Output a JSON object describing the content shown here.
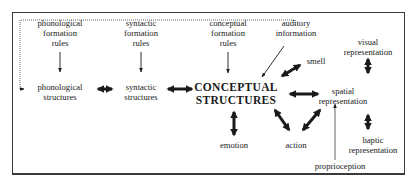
{
  "diagram": {
    "nodes": {
      "phonological_formation_rules": "phonological\nformation\nrules",
      "syntactic_formation_rules": "syntactic\nformation\nrules",
      "conceptual_formation_rules": "conceptual\nformation\nrules",
      "auditory_information": "auditory\ninformation",
      "visual_representation": "visual\nrepresentation",
      "smell": "smell",
      "phonological_structures": "phonological\nstructures",
      "syntactic_structures": "syntactic\nstructures",
      "conceptual_structures": "CONCEPTUAL\nSTRUCTURES",
      "spatial_representation": "spatial\nrepresentation",
      "emotion": "emotion",
      "action": "action",
      "haptic_representation": "haptic\nrepresentation",
      "proprioception": "proprioception"
    },
    "edges": [
      {
        "from": "phonological formation rules",
        "to": "phonological structures",
        "type": "one-way"
      },
      {
        "from": "syntactic formation rules",
        "to": "syntactic structures",
        "type": "one-way"
      },
      {
        "from": "conceptual formation rules",
        "to": "CONCEPTUAL STRUCTURES",
        "type": "one-way"
      },
      {
        "from": "auditory information",
        "to": "CONCEPTUAL STRUCTURES",
        "type": "one-way"
      },
      {
        "from": "auditory information",
        "to": "phonological structures",
        "type": "dotted"
      },
      {
        "from": "phonological structures",
        "to": "syntactic structures",
        "type": "two-way"
      },
      {
        "from": "syntactic structures",
        "to": "CONCEPTUAL STRUCTURES",
        "type": "two-way"
      },
      {
        "from": "CONCEPTUAL STRUCTURES",
        "to": "smell",
        "type": "two-way"
      },
      {
        "from": "CONCEPTUAL STRUCTURES",
        "to": "spatial representation",
        "type": "two-way"
      },
      {
        "from": "CONCEPTUAL STRUCTURES",
        "to": "emotion",
        "type": "two-way"
      },
      {
        "from": "CONCEPTUAL STRUCTURES",
        "to": "action",
        "type": "two-way"
      },
      {
        "from": "action",
        "to": "spatial representation",
        "type": "two-way"
      },
      {
        "from": "visual representation",
        "to": "spatial representation",
        "type": "two-way"
      },
      {
        "from": "spatial representation",
        "to": "haptic representation",
        "type": "two-way"
      },
      {
        "from": "proprioception",
        "to": "spatial representation",
        "type": "one-way"
      }
    ]
  }
}
